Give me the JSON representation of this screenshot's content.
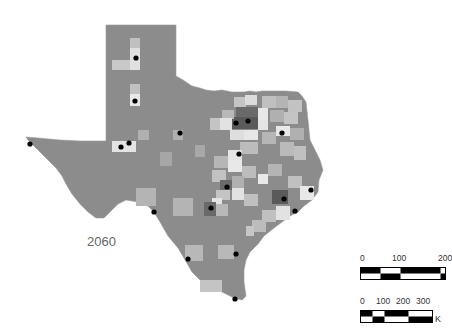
{
  "map": {
    "year_label": "2060",
    "colors": {
      "base": "#8c8c8c",
      "light": "#c8c8c8",
      "lighter": "#e2e2e2",
      "mid": "#a8a8a8",
      "dark": "#5a5a5a",
      "dot": "#000000"
    }
  },
  "scale_bars": [
    {
      "ticks": [
        "0",
        "100",
        "200"
      ],
      "unit": ""
    },
    {
      "ticks": [
        "0",
        "100",
        "200",
        "300"
      ],
      "unit": "K"
    }
  ]
}
